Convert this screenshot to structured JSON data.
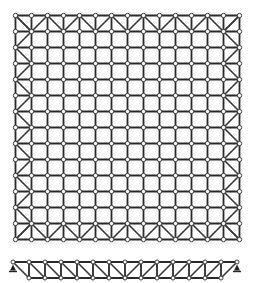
{
  "diagram": {
    "title": "Space frame grid — plan and elevation",
    "colors": {
      "background": "#ffffff",
      "member": "#2a2a2a",
      "diagonal": "#333333",
      "node_fill": "#ffffff",
      "node_stroke": "#3a3a3a",
      "support": "#222222"
    },
    "plan": {
      "label": "Plan view",
      "origin_x": 15.5,
      "origin_y": 15.5,
      "bays_x": 14,
      "bays_y": 14,
      "spacing": 16.0,
      "node_radius": 2.2,
      "perimeter_pattern": "warren-zigzag",
      "corner_diagonals": true
    },
    "elevation": {
      "label": "Elevation view",
      "top_chord_y": 262,
      "bottom_chord_y": 278,
      "top_nodes_x": [
        13,
        29,
        45,
        61,
        77,
        93,
        109,
        125,
        141,
        157,
        173,
        189,
        205,
        221,
        237
      ],
      "bottom_nodes_x": [
        29,
        45,
        61,
        77,
        93,
        109,
        125,
        141,
        157,
        173,
        189,
        205,
        221
      ],
      "center_x": 125,
      "node_radius": 2.0,
      "supports": [
        {
          "name": "left-support",
          "x": 13
        },
        {
          "name": "right-support",
          "x": 237
        }
      ]
    }
  }
}
